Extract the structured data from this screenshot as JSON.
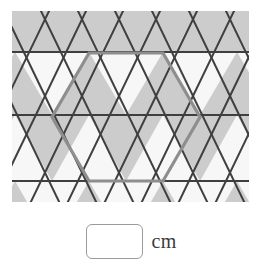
{
  "figure": {
    "name": "triangular-tessellation-with-highlighted-hexagon",
    "colors": {
      "shaded_triangle": "#cccccc",
      "unshaded_triangle": "#f7f7f7",
      "grid_line": "#3f3f3f",
      "hexagon_outline": "#8e8e8e",
      "background": "#ffffff",
      "input_border": "#9a9a9a",
      "text": "#3b3b3b"
    },
    "geometry": {
      "clip_left": 12,
      "clip_top": 11,
      "clip_right": 249,
      "clip_bottom": 202,
      "triangle_side": 74,
      "row_height": 64,
      "horizontal_line_y": [
        52,
        115,
        181
      ],
      "grid_line_width": 2,
      "hexagon_stroke_width": 3.2,
      "hexagon_center_x": 126,
      "hexagon_center_y": 117,
      "hexagon_circumradius": 74,
      "hexagon_vertices": [
        [
          89,
          53
        ],
        [
          163,
          53
        ],
        [
          200,
          117
        ],
        [
          163,
          181
        ],
        [
          89,
          181
        ],
        [
          52,
          117
        ]
      ]
    }
  },
  "answer": {
    "input_value": "",
    "input_placeholder": "",
    "unit_label": "cm"
  }
}
